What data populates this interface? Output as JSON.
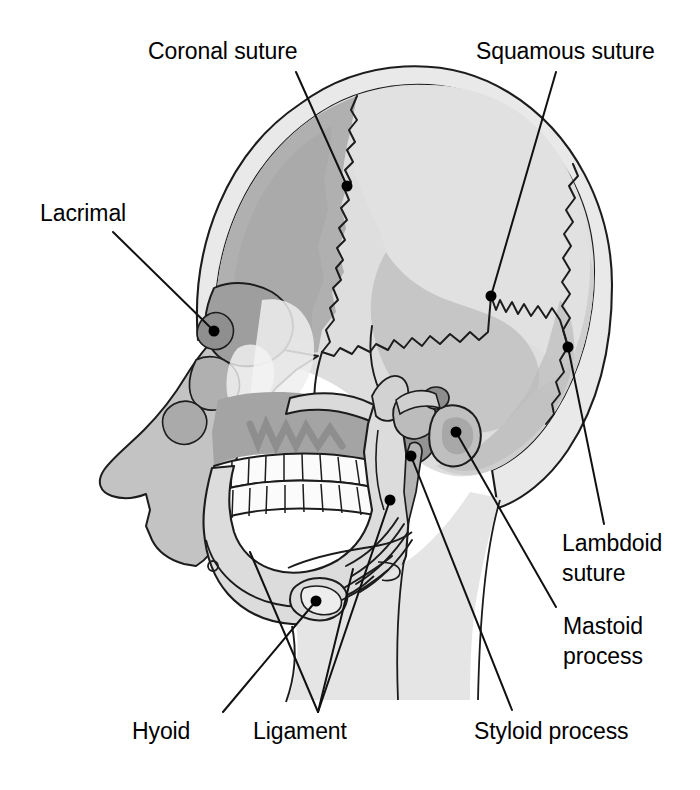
{
  "figure": {
    "kind": "anatomical-illustration",
    "background_color": "#ffffff",
    "line_color": "#1a1a1a",
    "text_color": "#000000"
  },
  "palette": {
    "outer_table": "#e8e8e8",
    "frontal_bone": "#b2b2b2",
    "parietal_bone": "#dedede",
    "temporal_bone": "#c8c8c8",
    "occipital_bone": "#d2d2d2",
    "sphenoid_dark": "#9a9a9a",
    "facial_mid": "#c4c4c4",
    "maxilla_dark": "#a8a8a8",
    "mandible_light": "#dcdcdc",
    "teeth_white": "#fbfbfb",
    "nasal_highlight": "#f2f2f2",
    "neck_light": "#e4e4e4",
    "dot_color": "#000000"
  },
  "labels": [
    {
      "id": "coronal-suture",
      "text": "Coronal suture",
      "x": 148,
      "y": 36,
      "lines": [
        "Coronal suture"
      ],
      "leader": {
        "from": [
          296,
          72
        ],
        "to": [
          347,
          186
        ]
      },
      "dot": [
        347,
        186
      ]
    },
    {
      "id": "squamous-suture",
      "text": "Squamous suture",
      "x": 476,
      "y": 36,
      "lines": [
        "Squamous suture"
      ],
      "leader": {
        "from": [
          556,
          72
        ],
        "to": [
          491,
          296
        ]
      },
      "dot": [
        491,
        296
      ]
    },
    {
      "id": "lacrimal",
      "text": "Lacrimal",
      "x": 40,
      "y": 198,
      "lines": [
        "Lacrimal"
      ],
      "leader": {
        "from": [
          113,
          232
        ],
        "to": [
          214,
          331
        ]
      },
      "dot": [
        214,
        331
      ]
    },
    {
      "id": "lambdoid-suture",
      "text": "Lambdoid suture",
      "x": 562,
      "y": 528,
      "lines": [
        "Lambdoid",
        "suture"
      ],
      "leader": {
        "from": [
          604,
          524
        ],
        "to": [
          568,
          347
        ]
      },
      "dot": [
        568,
        347
      ]
    },
    {
      "id": "mastoid-process",
      "text": "Mastoid process",
      "x": 563,
      "y": 611,
      "lines": [
        "Mastoid",
        "process"
      ],
      "leader": {
        "from": [
          556,
          607
        ],
        "to": [
          456,
          432
        ]
      },
      "dot": [
        456,
        432
      ]
    },
    {
      "id": "hyoid",
      "text": "Hyoid",
      "x": 132,
      "y": 716,
      "lines": [
        "Hyoid"
      ],
      "leader": {
        "from": [
          223,
          712
        ],
        "to": [
          316,
          601
        ]
      },
      "dot": [
        316,
        601
      ]
    },
    {
      "id": "ligament",
      "text": "Ligament",
      "x": 253,
      "y": 716,
      "lines": [
        "Ligament"
      ],
      "leader_multi": [
        {
          "from": [
            318,
            712
          ],
          "to": [
            250,
            552
          ]
        },
        {
          "from": [
            318,
            712
          ],
          "to": [
            390,
            500
          ]
        },
        {
          "from": [
            318,
            712
          ],
          "to": [
            353,
            569
          ]
        }
      ],
      "dot": [
        390,
        500
      ]
    },
    {
      "id": "styloid-process",
      "text": "Styloid process",
      "x": 474,
      "y": 716,
      "lines": [
        "Styloid process"
      ],
      "leader": {
        "from": [
          512,
          710
        ],
        "to": [
          411,
          456
        ]
      },
      "dot": [
        411,
        456
      ]
    }
  ],
  "structures": [
    {
      "name": "frontal-bone",
      "tone": "medium"
    },
    {
      "name": "parietal-bone",
      "tone": "light"
    },
    {
      "name": "temporal-bone",
      "tone": "mid"
    },
    {
      "name": "occipital-bone",
      "tone": "mid-light"
    },
    {
      "name": "sphenoid-bone",
      "tone": "dark"
    },
    {
      "name": "zygomatic-arch",
      "tone": "light"
    },
    {
      "name": "maxilla",
      "tone": "medium"
    },
    {
      "name": "mandible",
      "tone": "light"
    },
    {
      "name": "upper-teeth",
      "tone": "white"
    },
    {
      "name": "lower-teeth",
      "tone": "white"
    },
    {
      "name": "hyoid-bone",
      "tone": "light"
    },
    {
      "name": "stylohyoid-ligament",
      "tone": "line"
    },
    {
      "name": "mastoid-process",
      "tone": "mid"
    },
    {
      "name": "styloid-process",
      "tone": "mid"
    },
    {
      "name": "cervical-spine",
      "tone": "light"
    }
  ]
}
